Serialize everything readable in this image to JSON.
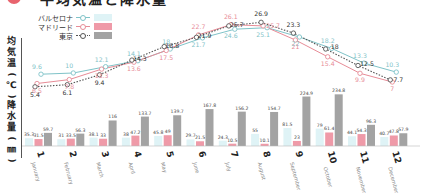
{
  "title": "平均気温と降水量",
  "legend": [
    {
      "label": "バルセロナ",
      "color": "#7fc3c8",
      "bar_color": "#dff3f6",
      "line_style": "solid"
    },
    {
      "label": "マドリード",
      "color": "#e78c97",
      "bar_color": "#ef9aa8",
      "line_style": "solid"
    },
    {
      "label": "東京",
      "color": "#555555",
      "bar_color": "#a3a3a3",
      "line_style": "dotted"
    }
  ],
  "axis_labels": {
    "temperature": "平均気温(℃)",
    "precipitation": "降水量(㎜)"
  },
  "chart_data": [
    {
      "type": "line",
      "title": "平均気温",
      "ylabel": "平均気温(℃)",
      "categories": [
        "1",
        "2",
        "3",
        "4",
        "5",
        "6",
        "7",
        "8",
        "9",
        "10",
        "11",
        "12"
      ],
      "series": [
        {
          "name": "バルセロナ",
          "values": [
            9.6,
            10,
            12.1,
            14.1,
            18,
            21.7,
            24.6,
            25.1,
            22,
            18.2,
            13.3,
            10.3
          ]
        },
        {
          "name": "マドリード",
          "values": [
            6.5,
            7.8,
            11.3,
            13.6,
            17.5,
            22.7,
            26.1,
            25.7,
            21,
            15.4,
            9.9,
            7
          ]
        },
        {
          "name": "東京",
          "values": [
            5.4,
            6.1,
            9.4,
            14.3,
            18.8,
            21.9,
            25.7,
            26.9,
            23.3,
            18,
            12.5,
            7.7
          ]
        }
      ],
      "ylim": [
        0,
        30
      ],
      "grid": false
    },
    {
      "type": "bar",
      "title": "降水量",
      "ylabel": "降水量(㎜)",
      "categories": [
        "1",
        "2",
        "3",
        "4",
        "5",
        "6",
        "7",
        "8",
        "9",
        "10",
        "11",
        "12"
      ],
      "month_names": [
        "January",
        "February",
        "March",
        "April",
        "May",
        "June",
        "July",
        "August",
        "September",
        "October",
        "November",
        "December"
      ],
      "series": [
        {
          "name": "バルセロナ",
          "values": [
            35.3,
            31,
            38.1,
            38,
            45.8,
            29.7,
            24.3,
            55,
            81.5,
            79,
            44.1,
            40.7
          ]
        },
        {
          "name": "マドリード",
          "values": [
            31.5,
            33.5,
            33,
            47.2,
            49,
            21.5,
            10.5,
            10.1,
            23,
            61.4,
            54.3,
            47.8
          ]
        },
        {
          "name": "東京",
          "values": [
            59.7,
            56.3,
            116,
            133.7,
            139.7,
            167.8,
            156.2,
            154.7,
            224.9,
            234.8,
            96.3,
            57.9
          ]
        }
      ],
      "ylim": [
        0,
        250
      ],
      "grid": false
    }
  ]
}
